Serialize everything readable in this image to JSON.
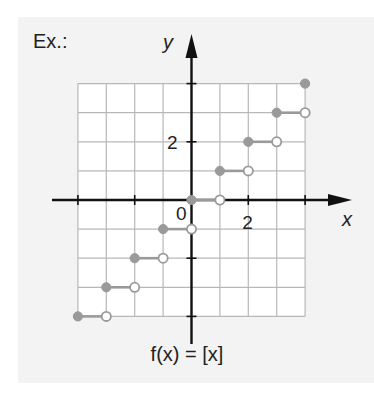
{
  "example_label": "Ex.:",
  "formula": "f(x) = [x]",
  "axes": {
    "x_label": "x",
    "y_label": "y",
    "origin_label": "0",
    "x_tick_label": "2",
    "y_tick_label": "2"
  },
  "colors": {
    "panel_bg": "#f3f3f3",
    "grid": "#b8b8b8",
    "axis": "#111111",
    "step": "#9a9a9a",
    "open_dot_fill": "#ffffff"
  },
  "chart_data": {
    "type": "line",
    "title": "f(x) = [x]",
    "subtitle": "Greatest integer (floor) step function",
    "xlabel": "x",
    "ylabel": "y",
    "xlim": [
      -4,
      4
    ],
    "ylim": [
      -4,
      4
    ],
    "grid": true,
    "x_ticks_labeled": [
      0,
      2
    ],
    "y_ticks_labeled": [
      2
    ],
    "series": [
      {
        "name": "f(x) = [x]",
        "segments": [
          {
            "x_start": -4,
            "x_end": -3,
            "y": -4,
            "start": "closed",
            "end": "open"
          },
          {
            "x_start": -3,
            "x_end": -2,
            "y": -3,
            "start": "closed",
            "end": "open"
          },
          {
            "x_start": -2,
            "x_end": -1,
            "y": -2,
            "start": "closed",
            "end": "open"
          },
          {
            "x_start": -1,
            "x_end": 0,
            "y": -1,
            "start": "closed",
            "end": "open"
          },
          {
            "x_start": 0,
            "x_end": 1,
            "y": 0,
            "start": "closed",
            "end": "open"
          },
          {
            "x_start": 1,
            "x_end": 2,
            "y": 1,
            "start": "closed",
            "end": "open"
          },
          {
            "x_start": 2,
            "x_end": 3,
            "y": 2,
            "start": "closed",
            "end": "open"
          },
          {
            "x_start": 3,
            "x_end": 4,
            "y": 3,
            "start": "closed",
            "end": "open"
          }
        ],
        "points": [
          {
            "x": 4,
            "y": 4,
            "type": "closed"
          }
        ]
      }
    ]
  }
}
